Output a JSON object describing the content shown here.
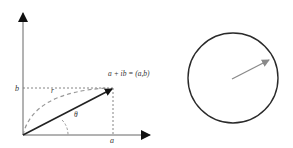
{
  "diagram": {
    "left_panel": {
      "axis_labels": {
        "x_tick": "a",
        "y_tick": "b"
      },
      "point_label": "a + ib = (a,b)",
      "radius_label": "r",
      "angle_label": "θ"
    },
    "right_panel": {
      "shape": "unit circle with vector"
    },
    "colors": {
      "axis": "#555555",
      "vector": "#222222",
      "dashed": "#777777",
      "arc": "#999999",
      "circle": "#2a2a2a",
      "circle_vector": "#8a8a8a"
    }
  }
}
